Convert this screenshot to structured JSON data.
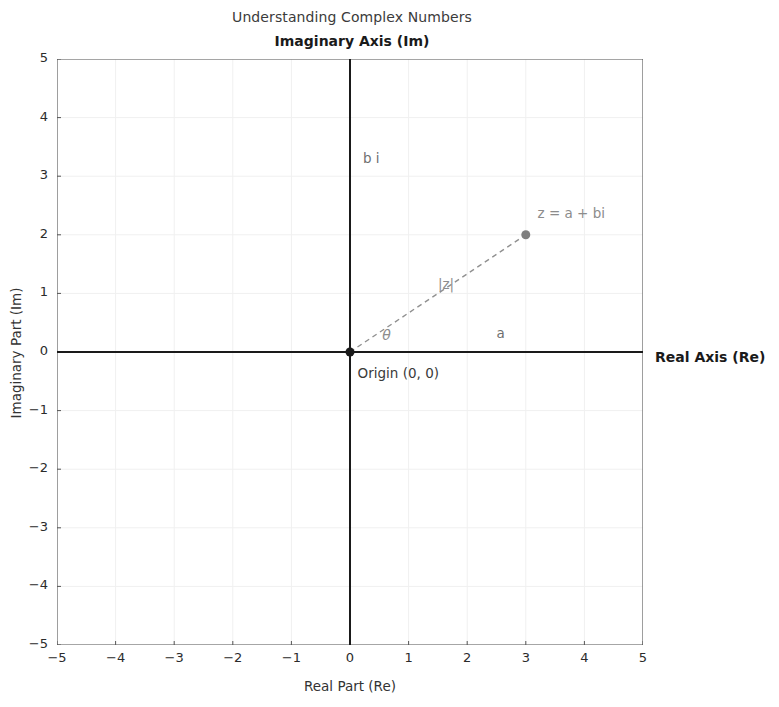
{
  "figure": {
    "title": "Understanding Complex Numbers",
    "imaginary_axis_name": "Imaginary Axis (Im)",
    "real_axis_name": "Real Axis (Re)",
    "xlabel": "Real Part (Re)",
    "ylabel": "Imaginary Part (Im)"
  },
  "annotations": {
    "point_label": "z = a + bi",
    "modulus_label": "|z|",
    "angle_label": "θ",
    "imaginary_component_label": "b i",
    "real_component_label": "a",
    "origin_label": "Origin (0, 0)"
  },
  "colors": {
    "axis": "#1a1a1a",
    "grid": "#f0f0f0",
    "vector": "#909090",
    "marker": "#7f7f7f",
    "text": "#262626",
    "background": "#ffffff"
  },
  "chart_data": {
    "type": "scatter",
    "title": "Understanding Complex Numbers",
    "xlabel": "Real Part (Re)",
    "ylabel": "Imaginary Part (Im)",
    "xlim": [
      -5,
      5
    ],
    "ylim": [
      -5,
      5
    ],
    "xticks": [
      -5,
      -4,
      -3,
      -2,
      -1,
      0,
      1,
      2,
      3,
      4,
      5
    ],
    "yticks": [
      -5,
      -4,
      -3,
      -2,
      -1,
      0,
      1,
      2,
      3,
      4,
      5
    ],
    "xticklabels": [
      "−5",
      "−4",
      "−3",
      "−2",
      "−1",
      "0",
      "1",
      "2",
      "3",
      "4",
      "5"
    ],
    "yticklabels": [
      "−5",
      "−4",
      "−3",
      "−2",
      "−1",
      "0",
      "1",
      "2",
      "3",
      "4",
      "5"
    ],
    "grid": true,
    "legend": false,
    "series": [
      {
        "name": "z = a + bi",
        "type": "scatter",
        "points": [
          {
            "x": 3,
            "y": 2
          }
        ],
        "marker": "o",
        "color": "#7f7f7f"
      },
      {
        "name": "modulus vector",
        "type": "line",
        "linestyle": "dashed",
        "color": "#909090",
        "points": [
          {
            "x": 0,
            "y": 0
          },
          {
            "x": 3,
            "y": 2
          }
        ]
      }
    ],
    "annotations": [
      {
        "text": "z = a + bi",
        "x": 3.2,
        "y": 2.35
      },
      {
        "text": "|z|",
        "x": 1.5,
        "y": 1.15
      },
      {
        "text": "θ",
        "x": 0.55,
        "y": 0.28
      },
      {
        "text": "b i",
        "x": 0.22,
        "y": 3.3
      },
      {
        "text": "a",
        "x": 2.5,
        "y": 0.3
      },
      {
        "text": "Origin (0, 0)",
        "x": 0.13,
        "y": -0.38
      }
    ]
  }
}
